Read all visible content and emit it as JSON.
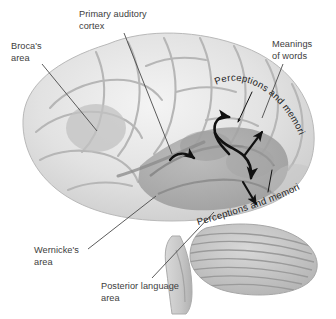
{
  "figure": {
    "background_color": "#ffffff",
    "text_color": "#3d3d3d",
    "arrow_color": "#111111"
  },
  "labels": {
    "brocas_area": "Broca's\narea",
    "primary_auditory_cortex": "Primary auditory\ncortex",
    "meanings_of_words": "Meanings\nof words",
    "wernickes_area": "Wernicke's\narea",
    "posterior_language_area": "Posterior language\narea"
  },
  "arc_labels": {
    "upper": "Perceptions and memories",
    "lower": "Perceptions and memories"
  },
  "anatomy": {
    "cerebrum": "cerebrum",
    "cerebellum": "cerebellum",
    "brainstem": "brainstem"
  },
  "colors": {
    "brain_light": "#ececec",
    "brain_mid": "#d2d2d2",
    "brain_shade": "#a8a8a8",
    "brain_dark": "#8d8d8d",
    "outline": "#9c9c9c",
    "leader_line": "#4a4a4a"
  }
}
